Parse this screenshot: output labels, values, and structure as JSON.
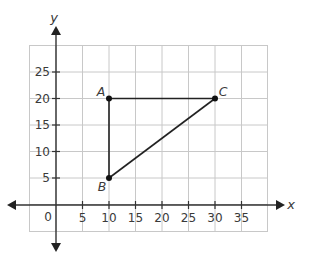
{
  "diagram": {
    "type": "coordinate-plane",
    "axes": {
      "x_label": "x",
      "y_label": "y",
      "origin_label": "0",
      "x_ticks": [
        "5",
        "10",
        "15",
        "20",
        "25",
        "30",
        "35"
      ],
      "y_ticks": [
        "5",
        "10",
        "15",
        "20",
        "25"
      ],
      "x_grid_range": [
        -5,
        40
      ],
      "y_grid_range": [
        -5,
        30
      ],
      "grid_step": 5
    },
    "points": [
      {
        "label": "A",
        "x": 10,
        "y": 20
      },
      {
        "label": "B",
        "x": 10,
        "y": 5
      },
      {
        "label": "C",
        "x": 30,
        "y": 20
      }
    ],
    "segments": [
      {
        "from": "A",
        "to": "C"
      },
      {
        "from": "A",
        "to": "B"
      },
      {
        "from": "B",
        "to": "C"
      }
    ],
    "colors": {
      "grid": "#c8c8c8",
      "axis": "#333333",
      "shape": "#222222",
      "text": "#3a3a3a"
    }
  }
}
